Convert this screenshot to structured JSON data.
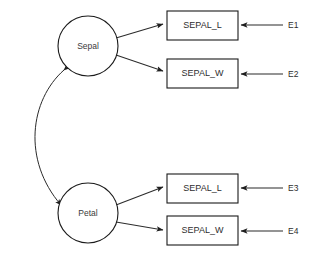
{
  "diagram": {
    "type": "path-diagram",
    "title": "",
    "background_color": "#ffffff",
    "stroke_color": "#2b2b2b",
    "text_color": "#2e2e2e",
    "latent_variables": [
      {
        "id": "sepal",
        "label": "Sepal",
        "shape": "circle",
        "cx": 88,
        "cy": 46,
        "r": 30
      },
      {
        "id": "petal",
        "label": "Petal",
        "shape": "circle",
        "cx": 88,
        "cy": 213,
        "r": 30
      }
    ],
    "observed_variables": [
      {
        "id": "ind1",
        "label": "SEPAL_L",
        "shape": "rect",
        "x": 167,
        "y": 11,
        "w": 71,
        "h": 29
      },
      {
        "id": "ind2",
        "label": "SEPAL_W",
        "shape": "rect",
        "x": 167,
        "y": 59,
        "w": 71,
        "h": 29
      },
      {
        "id": "ind3",
        "label": "SEPAL_L",
        "shape": "rect",
        "x": 167,
        "y": 174,
        "w": 71,
        "h": 29
      },
      {
        "id": "ind4",
        "label": "SEPAL_W",
        "shape": "rect",
        "x": 167,
        "y": 216,
        "w": 71,
        "h": 29
      }
    ],
    "error_terms": [
      {
        "id": "e1",
        "label": "E1",
        "x": 288,
        "y": 25
      },
      {
        "id": "e2",
        "label": "E2",
        "x": 288,
        "y": 74
      },
      {
        "id": "e3",
        "label": "E3",
        "x": 288,
        "y": 188
      },
      {
        "id": "e4",
        "label": "E4",
        "x": 288,
        "y": 231
      }
    ],
    "loading_edges": [
      {
        "from": "sepal",
        "to": "ind1",
        "arrow": "single"
      },
      {
        "from": "sepal",
        "to": "ind2",
        "arrow": "single"
      },
      {
        "from": "petal",
        "to": "ind3",
        "arrow": "single"
      },
      {
        "from": "petal",
        "to": "ind4",
        "arrow": "single"
      }
    ],
    "error_edges": [
      {
        "from": "e1",
        "to": "ind1",
        "arrow": "single"
      },
      {
        "from": "e2",
        "to": "ind2",
        "arrow": "single"
      },
      {
        "from": "e3",
        "to": "ind3",
        "arrow": "single"
      },
      {
        "from": "e4",
        "to": "ind4",
        "arrow": "single"
      }
    ],
    "covariance_edge": {
      "from": "sepal",
      "to": "petal",
      "arrow": "double",
      "style": "curved"
    }
  }
}
